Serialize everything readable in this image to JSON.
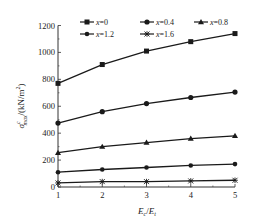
{
  "chart_data": {
    "type": "line",
    "title": "",
    "xlabel": "E_c/E_t",
    "ylabel": "σ^c_max/(kN/m²)",
    "x": [
      1,
      2,
      3,
      4,
      5
    ],
    "xlim": [
      1,
      5
    ],
    "ylim": [
      0,
      1200
    ],
    "xticks": [
      1,
      2,
      3,
      4,
      5
    ],
    "yticks": [
      0,
      200,
      400,
      600,
      800,
      1000,
      1200
    ],
    "grid": false,
    "legend_position": "top",
    "series": [
      {
        "name": "x=0",
        "marker": "square",
        "values": [
          770,
          910,
          1010,
          1080,
          1140
        ]
      },
      {
        "name": "x=0.4",
        "marker": "diamond",
        "values": [
          475,
          560,
          620,
          665,
          705
        ]
      },
      {
        "name": "x=0.8",
        "marker": "triangle",
        "values": [
          255,
          300,
          330,
          360,
          380
        ]
      },
      {
        "name": "x=1.2",
        "marker": "circle",
        "values": [
          110,
          130,
          145,
          160,
          170
        ]
      },
      {
        "name": "x=1.6",
        "marker": "asterisk",
        "values": [
          30,
          40,
          40,
          45,
          50
        ]
      }
    ]
  },
  "labels": {
    "xlabel_main": "E",
    "xlabel_sub1": "c",
    "xlabel_slash": "/",
    "xlabel_main2": "E",
    "xlabel_sub2": "t",
    "ylabel_sigma": "σ",
    "ylabel_sup": "c",
    "ylabel_sub": "max",
    "ylabel_unit": "/(kN/m",
    "ylabel_sq": "2",
    "ylabel_close": ")"
  },
  "colors": {
    "line": "#1a1a1a",
    "axis": "#333333"
  }
}
